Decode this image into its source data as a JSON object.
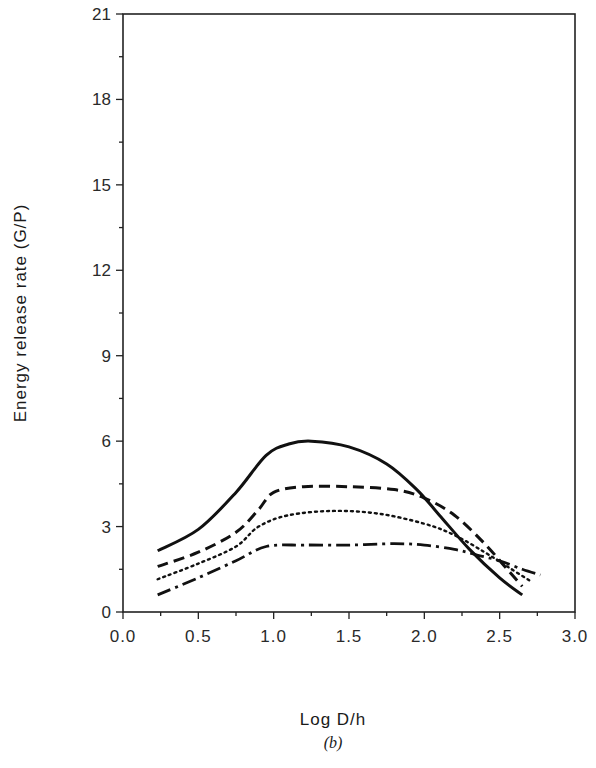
{
  "chart_data": {
    "type": "line",
    "title": "",
    "caption": "(b)",
    "xlabel": "Log D/h",
    "ylabel": "Energy  release  rate  (G/P)",
    "xlim": [
      0.0,
      3.0
    ],
    "ylim": [
      0,
      21
    ],
    "xticks": [
      0.0,
      0.5,
      1.0,
      1.5,
      2.0,
      2.5,
      3.0
    ],
    "xtick_labels": [
      "0.0",
      "0.5",
      "1.0",
      "1.5",
      "2.0",
      "2.5",
      "3.0"
    ],
    "xminor_step": 0.25,
    "yticks": [
      0,
      3,
      6,
      9,
      12,
      15,
      18,
      21
    ],
    "ytick_labels": [
      "0",
      "3",
      "6",
      "9",
      "12",
      "15",
      "18",
      "21"
    ],
    "yminor_step": 1.5,
    "grid": false,
    "legend": null,
    "series": [
      {
        "name": "solid",
        "style": "solid",
        "x": [
          0.23,
          0.5,
          0.75,
          0.95,
          1.1,
          1.25,
          1.5,
          1.75,
          1.95,
          2.1,
          2.3,
          2.5,
          2.65
        ],
        "y": [
          2.15,
          2.9,
          4.2,
          5.5,
          5.9,
          6.0,
          5.8,
          5.2,
          4.3,
          3.4,
          2.2,
          1.2,
          0.6
        ]
      },
      {
        "name": "dashed",
        "style": "dashed",
        "x": [
          0.23,
          0.5,
          0.75,
          0.9,
          1.0,
          1.2,
          1.5,
          1.8,
          2.0,
          2.2,
          2.4,
          2.55,
          2.65
        ],
        "y": [
          1.6,
          2.1,
          2.8,
          3.6,
          4.2,
          4.4,
          4.4,
          4.3,
          4.0,
          3.4,
          2.4,
          1.5,
          0.9
        ]
      },
      {
        "name": "dotted",
        "style": "dotted",
        "x": [
          0.23,
          0.5,
          0.75,
          0.9,
          1.1,
          1.4,
          1.7,
          2.0,
          2.2,
          2.4,
          2.55,
          2.7
        ],
        "y": [
          1.15,
          1.7,
          2.3,
          3.0,
          3.4,
          3.55,
          3.45,
          3.1,
          2.7,
          2.1,
          1.6,
          1.1
        ]
      },
      {
        "name": "dash-dot",
        "style": "dashdot",
        "x": [
          0.23,
          0.5,
          0.75,
          0.95,
          1.2,
          1.5,
          1.8,
          2.0,
          2.2,
          2.35,
          2.5,
          2.65,
          2.77
        ],
        "y": [
          0.6,
          1.2,
          1.8,
          2.3,
          2.35,
          2.35,
          2.4,
          2.35,
          2.2,
          2.0,
          1.8,
          1.5,
          1.3
        ]
      }
    ]
  },
  "colors": {
    "line": "#111111",
    "axis": "#222222",
    "background": "#ffffff"
  }
}
